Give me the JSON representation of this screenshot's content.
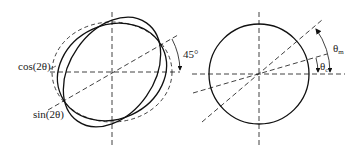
{
  "figure": {
    "left_panel": {
      "labels": {
        "cos": "cos(2θ)",
        "sin": "sin(2θ)",
        "angle": "45°"
      },
      "elements": [
        "dashed-circle",
        "solid-ellipse-cos",
        "solid-ellipse-sin",
        "dashed-horizontal-axis",
        "dashed-vertical-axis",
        "dashed-45-diagonal"
      ]
    },
    "right_panel": {
      "labels": {
        "theta_m_main": "θ",
        "theta_m_sub": "m",
        "theta_c_main": "θ",
        "theta_c_sub": "c"
      },
      "elements": [
        "solid-circle",
        "dashed-horizontal-axis",
        "dashed-vertical-axis",
        "dashed-diagonal-theta-c",
        "dashed-diagonal-theta-m"
      ]
    },
    "colors": {
      "stroke": "#111111",
      "background": "#ffffff"
    }
  }
}
